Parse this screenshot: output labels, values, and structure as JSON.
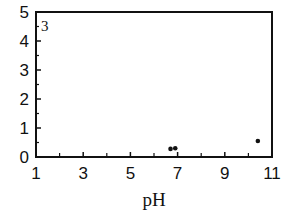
{
  "chart_data": {
    "type": "scatter",
    "title": "",
    "panel_label": "3",
    "xlabel": "pH",
    "ylabel": "",
    "xlim": [
      1,
      11
    ],
    "ylim": [
      0,
      5
    ],
    "x_ticks": [
      1,
      3,
      5,
      7,
      9,
      11
    ],
    "x_minor_ticks": [
      2,
      4,
      6,
      8,
      10
    ],
    "y_ticks": [
      0,
      1,
      2,
      3,
      4,
      5
    ],
    "y_minor_step": 0.5,
    "grid": false,
    "legend": null,
    "series": [
      {
        "name": "data",
        "points": [
          {
            "x": 6.7,
            "y": 0.28
          },
          {
            "x": 6.9,
            "y": 0.3
          },
          {
            "x": 10.4,
            "y": 0.55
          }
        ]
      }
    ]
  }
}
